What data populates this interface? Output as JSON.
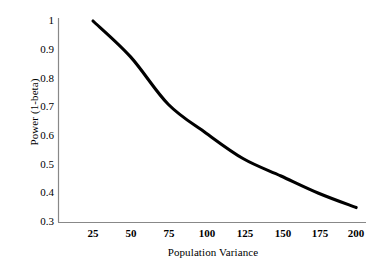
{
  "chart_data": {
    "type": "line",
    "title": "",
    "xlabel": "Population Variance",
    "ylabel": "Power (1-beta)",
    "x": [
      25,
      50,
      75,
      100,
      125,
      150,
      175,
      200
    ],
    "values": [
      1.0,
      0.875,
      0.71,
      0.61,
      0.52,
      0.46,
      0.4,
      0.35
    ],
    "series": [
      {
        "name": "Power",
        "values": [
          1.0,
          0.875,
          0.71,
          0.61,
          0.52,
          0.46,
          0.4,
          0.35
        ]
      }
    ],
    "xlim": [
      12.5,
      206.5
    ],
    "ylim": [
      0.3,
      1.0
    ],
    "xticks": [
      25,
      50,
      75,
      100,
      125,
      150,
      175,
      200
    ],
    "yticks": [
      0.3,
      0.4,
      0.5,
      0.6,
      0.7,
      0.8,
      0.9,
      1.0
    ],
    "xtick_labels": [
      "25",
      "50",
      "75",
      "100",
      "125",
      "150",
      "175",
      "200"
    ],
    "ytick_labels": [
      "0.3",
      "0.4",
      "0.5",
      "0.6",
      "0.7",
      "0.8",
      "0.9",
      "1"
    ],
    "grid": false,
    "legend": false,
    "line_color": "#000000",
    "line_width": 3,
    "axis_color": "#808080",
    "background_color": "#ffffff"
  },
  "axes": {
    "y_title": "Power (1-beta)",
    "x_title": "Population Variance"
  },
  "ytick_labels": {
    "t0": "1",
    "t1": "0.9",
    "t2": "0.8",
    "t3": "0.7",
    "t4": "0.6",
    "t5": "0.5",
    "t6": "0.4",
    "t7": "0.3"
  },
  "xtick_labels": {
    "t0": "25",
    "t1": "50",
    "t2": "75",
    "t3": "100",
    "t4": "125",
    "t5": "150",
    "t6": "175",
    "t7": "200"
  }
}
